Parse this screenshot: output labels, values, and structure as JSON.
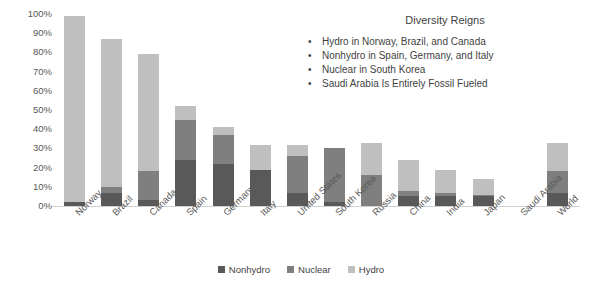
{
  "chart_data": {
    "type": "bar",
    "stacked": true,
    "title": "Diversity Reigns",
    "xlabel": "",
    "ylabel": "",
    "ylim": [
      0,
      100
    ],
    "ytick_labels": [
      "100%",
      "90%",
      "80%",
      "70%",
      "60%",
      "50%",
      "40%",
      "30%",
      "20%",
      "10%",
      "0%"
    ],
    "ytick_values": [
      100,
      90,
      80,
      70,
      60,
      50,
      40,
      30,
      20,
      10,
      0
    ],
    "grid": false,
    "legend_position": "bottom-center",
    "categories": [
      "Norway",
      "Brazil",
      "Canada",
      "Spain",
      "Germany",
      "Italy",
      "United States",
      "South Korea",
      "Russia",
      "China",
      "India",
      "Japan",
      "Saudi Arabia",
      "World"
    ],
    "series": [
      {
        "name": "Nonhydro",
        "color": "#595959",
        "values": [
          2,
          7,
          3,
          24,
          22,
          19,
          7,
          2,
          0,
          5,
          5,
          5,
          0,
          7
        ]
      },
      {
        "name": "Nuclear",
        "color": "#7f7f7f",
        "values": [
          0,
          3,
          15,
          21,
          15,
          0,
          19,
          28,
          16,
          3,
          2,
          1,
          0,
          11
        ]
      },
      {
        "name": "Hydro",
        "color": "#bfbfbf",
        "values": [
          97,
          77,
          61,
          7,
          4,
          13,
          6,
          0,
          17,
          16,
          12,
          8,
          0,
          15
        ]
      }
    ],
    "totals": [
      99,
      87,
      79,
      52,
      41,
      32,
      32,
      30,
      33,
      24,
      19,
      14,
      0,
      33
    ],
    "annotations": [
      "Hydro in Norway, Brazil, and Canada",
      "Nonhydro in Spain, Germany, and Italy",
      "Nuclear in South Korea",
      "Saudi Arabia Is Entirely Fossil Fueled"
    ],
    "bullet_glyph": "•"
  }
}
